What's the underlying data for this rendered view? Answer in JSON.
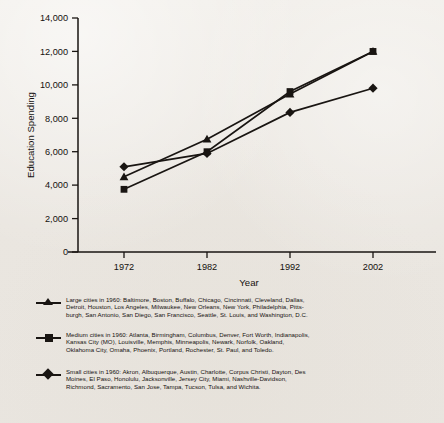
{
  "chart_data": {
    "type": "line",
    "title": "",
    "xlabel": "Year",
    "ylabel": "Education Spending",
    "categories": [
      "1972",
      "1982",
      "1992",
      "2002"
    ],
    "x": [
      1972,
      1982,
      1992,
      2002
    ],
    "xlim": [
      1967,
      2007
    ],
    "ylim": [
      0,
      14000
    ],
    "yticks": [
      0,
      2000,
      4000,
      6000,
      8000,
      10000,
      12000,
      14000
    ],
    "ytick_labels": [
      "0",
      "2,000",
      "4,000",
      "6,000",
      "8,000",
      "10,000",
      "12,000",
      "14,000"
    ],
    "grid": false,
    "legend_position": "below-plot",
    "series": [
      {
        "name": "Large cities",
        "marker": "triangle",
        "color": "#191512",
        "values": [
          4500,
          6750,
          9450,
          12000
        ]
      },
      {
        "name": "Medium cities",
        "marker": "square",
        "color": "#191512",
        "values": [
          3750,
          6000,
          9600,
          12000
        ]
      },
      {
        "name": "Small cities",
        "marker": "diamond",
        "color": "#191512",
        "values": [
          5100,
          5900,
          8350,
          9800
        ]
      }
    ]
  },
  "axes": {
    "y_title": "Education Spending",
    "x_title": "Year",
    "y_labels": [
      "14,000",
      "12,000",
      "10,000",
      "8,000",
      "6,000",
      "4,000",
      "2,000",
      "0"
    ],
    "x_labels": [
      "1972",
      "1982",
      "1992",
      "2002"
    ]
  },
  "legend": {
    "entries": [
      {
        "marker": "triangle",
        "marker_icon": "triangle-marker-icon",
        "lines": [
          "Large cities in 1960: Baltimore, Boston, Buffalo, Chicago, Cincinnati, Cleveland, Dallas,",
          "Detroit, Houston, Los Angeles, Milwaukee, New Orleans, New York, Philadelphia, Pitts-",
          "burgh, San Antonio, San Diego, San Francisco, Seattle, St. Louis, and Washington, D.C."
        ]
      },
      {
        "marker": "square",
        "marker_icon": "square-marker-icon",
        "lines": [
          "Medium cities in 1960: Atlanta, Birmingham, Columbus, Denver, Fort Worth, Indianapolis,",
          "Kansas City (MO), Louisville, Memphis, Minneapolis, Newark, Norfolk, Oakland,",
          "Oklahoma City, Omaha, Phoenix, Portland, Rochester, St. Paul, and Toledo."
        ]
      },
      {
        "marker": "diamond",
        "marker_icon": "diamond-marker-icon",
        "lines": [
          "Small cities in 1960: Akron, Albuquerque, Austin, Charlotte, Corpus Christi, Dayton, Des",
          "Moines, El Paso, Honolulu, Jacksonville, Jersey City, Miami, Nashville-Davidson,",
          "Richmond, Sacramento, San Jose, Tampa, Tucson, Tulsa, and Wichita."
        ]
      }
    ]
  },
  "colors": {
    "ink": "#191512",
    "paper": "#edeae5"
  }
}
